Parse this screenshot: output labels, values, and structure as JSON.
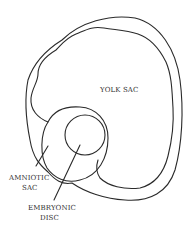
{
  "diagram": {
    "labels": {
      "yolk_sac": "YOLK SAC",
      "amniotic_sac_line1": "AMNIOTIC",
      "amniotic_sac_line2": "SAC",
      "embryonic_disc_line1": "EMBRYONIC",
      "embryonic_disc_line2": "DISC"
    },
    "colors": {
      "stroke": "#2a2a2a",
      "text": "#333333",
      "background": "#ffffff"
    }
  }
}
